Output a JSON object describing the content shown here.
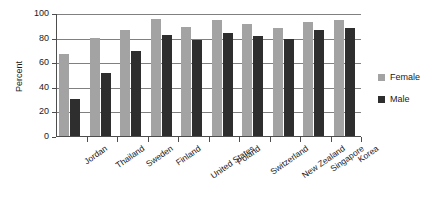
{
  "chart_data": {
    "type": "bar",
    "title": "",
    "xlabel": "",
    "ylabel": "Percent",
    "ylim": [
      0,
      100
    ],
    "yticks": [
      0,
      20,
      40,
      60,
      80,
      100
    ],
    "grid": true,
    "legend_position": "right",
    "categories": [
      "Jordan",
      "Thailand",
      "Sweden",
      "Finland",
      "United States",
      "Poland",
      "Switzerland",
      "New Zealand",
      "Singapore",
      "Korea"
    ],
    "series": [
      {
        "name": "Female",
        "color": "#a3a3a3",
        "values": [
          67,
          80,
          86,
          95,
          89,
          94,
          91,
          88,
          93,
          94
        ]
      },
      {
        "name": "Male",
        "color": "#2e2e2e",
        "values": [
          30,
          51,
          69,
          82,
          78,
          84,
          81,
          79,
          86,
          88
        ]
      }
    ]
  }
}
